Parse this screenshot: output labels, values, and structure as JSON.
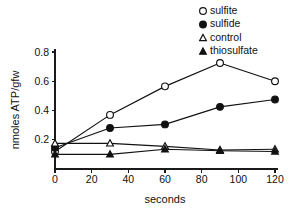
{
  "chart_data": {
    "type": "line",
    "title": "",
    "subtitle": "",
    "xlabel": "seconds",
    "ylabel": "nmoles ATP/gfw",
    "x": [
      0,
      30,
      60,
      90,
      120
    ],
    "xlim": [
      0,
      120
    ],
    "ylim": [
      0,
      0.8
    ],
    "xticks": [
      0,
      20,
      40,
      60,
      80,
      100,
      120
    ],
    "xticklabels": [
      "0",
      "20",
      "40",
      "60",
      "80",
      "100",
      "120"
    ],
    "yticks": [
      0.2,
      0.4,
      0.6,
      0.8
    ],
    "yticklabels": [
      "0.2",
      "0.4",
      "0.6",
      "0.8"
    ],
    "grid": false,
    "legend_position": "top-right",
    "series": [
      {
        "name": "sulfite",
        "marker": "open-circle",
        "color": "#111111",
        "values": [
          0.12,
          0.37,
          0.565,
          0.725,
          0.6
        ]
      },
      {
        "name": "sulfide",
        "marker": "filled-circle",
        "color": "#111111",
        "values": [
          0.145,
          0.28,
          0.305,
          0.425,
          0.475
        ]
      },
      {
        "name": "control",
        "marker": "open-triangle",
        "color": "#111111",
        "values": [
          0.175,
          0.175,
          0.155,
          0.13,
          0.135
        ]
      },
      {
        "name": "thiosulfate",
        "marker": "filled-triangle",
        "color": "#111111",
        "values": [
          0.1,
          0.1,
          0.135,
          0.125,
          0.12
        ]
      }
    ]
  },
  "legend": {
    "items": [
      {
        "label": "sulfite",
        "marker": "open-circle"
      },
      {
        "label": "sulfide",
        "marker": "filled-circle"
      },
      {
        "label": "control",
        "marker": "open-triangle"
      },
      {
        "label": "thiosulfate",
        "marker": "filled-triangle"
      }
    ]
  },
  "axes": {
    "x_title": "seconds",
    "y_title": "nmoles ATP/gfw"
  }
}
